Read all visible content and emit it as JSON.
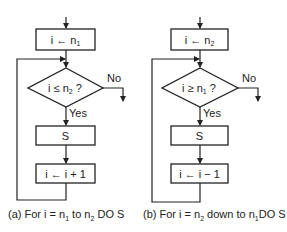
{
  "diagrams": [
    {
      "id": "a",
      "init_box": {
        "var": "i",
        "arrow": "←",
        "value": "n",
        "sub": "1"
      },
      "condition": {
        "var": "i",
        "op": "≤",
        "value": "n",
        "sub": "2",
        "q": "?"
      },
      "no_label": "No",
      "yes_label": "Yes",
      "body_box": "S",
      "update_box": "i ← i + 1",
      "caption": {
        "prefix": "(a) For i = n",
        "sub1": "1",
        "mid": " to n",
        "sub2": "2",
        "suffix": " DO S"
      }
    },
    {
      "id": "b",
      "init_box": {
        "var": "i",
        "arrow": "←",
        "value": "n",
        "sub": "2"
      },
      "condition": {
        "var": "i",
        "op": "≥",
        "value": "n",
        "sub": "1",
        "q": "?"
      },
      "no_label": "No",
      "yes_label": "Yes",
      "body_box": "S",
      "update_box": "i ← i − 1",
      "caption": {
        "prefix": "(b) For i = n",
        "sub1": "2",
        "mid": " down to n",
        "sub2": "1",
        "suffix": "DO S"
      }
    }
  ]
}
